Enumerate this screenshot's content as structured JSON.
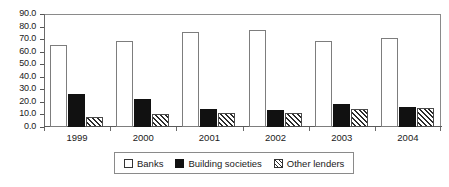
{
  "chart_data": {
    "type": "bar",
    "title": "",
    "subtitle": "",
    "xlabel": "",
    "ylabel": "",
    "categories": [
      "1999",
      "2000",
      "2001",
      "2002",
      "2003",
      "2004"
    ],
    "series": [
      {
        "name": "Banks",
        "swatch": "white-outline-swatch",
        "values": [
          65.5,
          68.5,
          76.0,
          77.0,
          68.5,
          70.5
        ]
      },
      {
        "name": "Building societies",
        "swatch": "solid-black-swatch",
        "values": [
          26.5,
          22.5,
          14.5,
          13.5,
          18.5,
          16.0
        ]
      },
      {
        "name": "Other lenders",
        "swatch": "diagonal-hatch-swatch",
        "values": [
          8.0,
          10.5,
          11.0,
          11.0,
          14.5,
          15.5
        ]
      }
    ],
    "ylim": [
      0.0,
      90.0
    ],
    "ytick_labels": [
      "90.0",
      "80.0",
      "70.0",
      "60.0",
      "50.0",
      "40.0",
      "30.0",
      "20.0",
      "10.0",
      "0.0"
    ],
    "ytick_values": [
      90.0,
      80.0,
      70.0,
      60.0,
      50.0,
      40.0,
      30.0,
      20.0,
      10.0,
      0.0
    ],
    "grid": false,
    "legend_position": "bottom",
    "colors": {
      "banks": "#ffffff",
      "building_societies": "#111111",
      "other_lenders_hatch": "#2b2b2b",
      "axis": "#6a6a6a",
      "text": "#1a1a1a",
      "background": "#ffffff"
    }
  }
}
